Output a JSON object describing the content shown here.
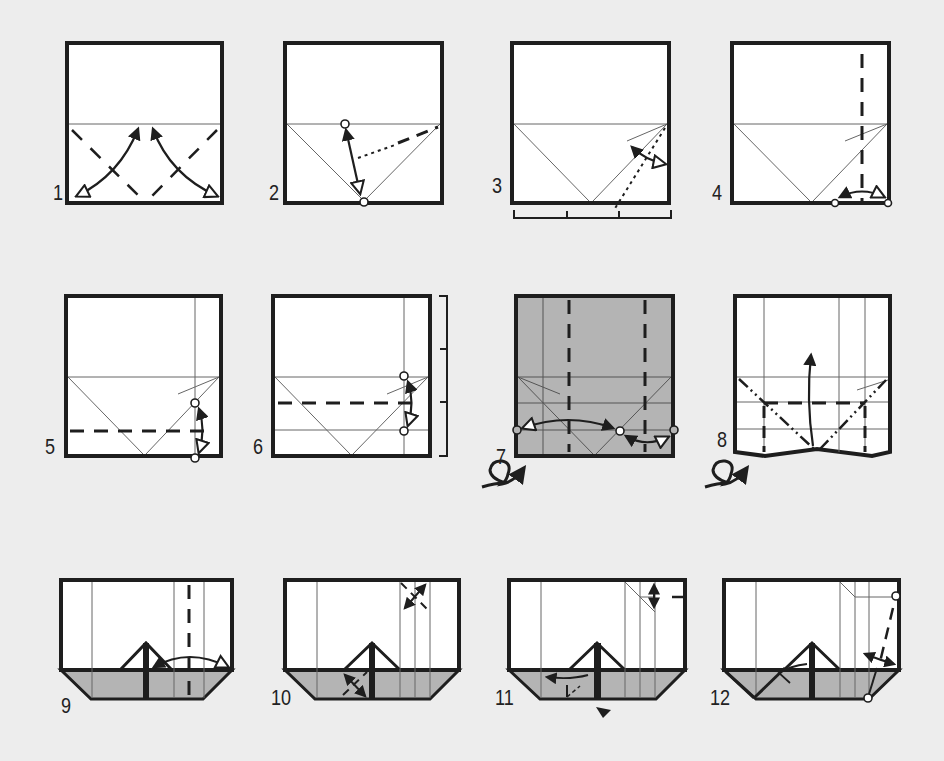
{
  "diagram": {
    "type": "origami-folding-instructions",
    "background_color": "#ededed",
    "paper_color": "#ffffff",
    "shaded_color": "#b4b4b4",
    "line_color": "#1e1e1e",
    "steps": [
      {
        "number": "1",
        "symbols": [
          "valley-fold-diagonals",
          "fold-and-unfold-arrows"
        ]
      },
      {
        "number": "2",
        "symbols": [
          "pinch-point-circles",
          "fold-and-unfold-arrow",
          "dotted-guide-line"
        ]
      },
      {
        "number": "3",
        "symbols": [
          "fold-and-unfold-arrow",
          "dotted-guide-line",
          "thirds-measure-bracket"
        ]
      },
      {
        "number": "4",
        "symbols": [
          "vertical-valley-fold",
          "fold-and-unfold-arrow",
          "reference-circles"
        ]
      },
      {
        "number": "5",
        "symbols": [
          "horizontal-valley-fold",
          "fold-and-unfold-arrow",
          "reference-circles"
        ]
      },
      {
        "number": "6",
        "symbols": [
          "horizontal-valley-fold",
          "fold-and-unfold-arrow",
          "quarters-measure-bracket"
        ]
      },
      {
        "number": "7",
        "symbols": [
          "colored-side-up",
          "vertical-valley-folds",
          "fold-and-unfold-arrows",
          "turn-over-icon"
        ]
      },
      {
        "number": "8",
        "symbols": [
          "mountain-folds",
          "valley-folds",
          "fold-up-arrow",
          "turn-over-icon"
        ]
      },
      {
        "number": "9",
        "symbols": [
          "vertical-valley-fold",
          "fold-and-unfold-arrow"
        ]
      },
      {
        "number": "10",
        "symbols": [
          "corner-fold-and-unfold-arrows"
        ]
      },
      {
        "number": "11",
        "symbols": [
          "fold-arrow",
          "push-in-arrowhead",
          "corner-fold-and-unfold-arrow"
        ]
      },
      {
        "number": "12",
        "symbols": [
          "valley-fold",
          "fold-and-unfold-arrow",
          "reference-circles"
        ]
      }
    ]
  }
}
